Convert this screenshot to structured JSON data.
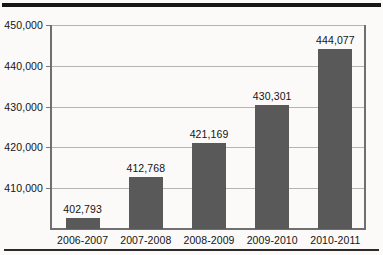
{
  "chart_data": {
    "type": "bar",
    "title": "",
    "subtitle": "",
    "xlabel": "",
    "ylabel": "",
    "categories": [
      "2006-2007",
      "2007-2008",
      "2008-2009",
      "2009-2010",
      "2010-2011"
    ],
    "values": [
      402793,
      412768,
      421169,
      430301,
      444077
    ],
    "value_labels": [
      "402,793",
      "412,768",
      "421,169",
      "430,301",
      "444,077"
    ],
    "ylim": [
      400000,
      450000
    ],
    "ytick_values": [
      410000,
      420000,
      430000,
      440000,
      450000
    ],
    "ytick_labels": [
      "410,000",
      "420,000",
      "430,000",
      "440,000",
      "450,000"
    ],
    "grid": true,
    "legend": false,
    "legend_position": "none",
    "bar_color": "#595959",
    "gridline_color": "#b4b4b4",
    "axis_color": "#6f6f6f",
    "text_color": "#141414",
    "background_color": "#fbfaf8"
  }
}
